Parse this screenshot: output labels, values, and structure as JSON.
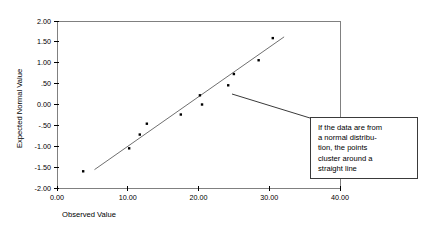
{
  "chart_data": {
    "type": "scatter",
    "title": "",
    "xlabel": "Observed Value",
    "ylabel": "Expected Normal Value",
    "xlim": [
      0,
      40
    ],
    "ylim": [
      -2.0,
      2.0
    ],
    "grid": false,
    "legend": null,
    "x_ticks": [
      "0.00",
      "10.00",
      "20.00",
      "30.00",
      "40.00"
    ],
    "x_tick_values": [
      0,
      10,
      20,
      30,
      40
    ],
    "y_ticks": [
      "2.00",
      "1.50",
      "1.00",
      ".50",
      "0.00",
      "-.50",
      "-1.00",
      "-1.50",
      "-2.00"
    ],
    "y_tick_values": [
      2.0,
      1.5,
      1.0,
      0.5,
      0.0,
      -0.5,
      -1.0,
      -1.5,
      -2.0
    ],
    "points": [
      {
        "x": 3.7,
        "y": -1.6
      },
      {
        "x": 10.2,
        "y": -1.05
      },
      {
        "x": 11.7,
        "y": -0.72
      },
      {
        "x": 12.7,
        "y": -0.46
      },
      {
        "x": 17.5,
        "y": -0.24
      },
      {
        "x": 20.2,
        "y": 0.22
      },
      {
        "x": 20.5,
        "y": 0.0
      },
      {
        "x": 24.2,
        "y": 0.46
      },
      {
        "x": 25.0,
        "y": 0.73
      },
      {
        "x": 28.5,
        "y": 1.06
      },
      {
        "x": 30.5,
        "y": 1.59
      }
    ],
    "fit_line": {
      "x1": 5.3,
      "y1": -1.56,
      "x2": 32.1,
      "y2": 1.62
    },
    "marker": {
      "shape": "square",
      "color": "#000000",
      "size": 2.4
    },
    "line_color": "#707070",
    "frame_color": "#808080"
  },
  "annotation": {
    "text": "If the data are from\na normal distribu-\ntion, the points\ncluster around a\nstraight line",
    "leader": {
      "x1": 232,
      "y1": 94,
      "x2": 310,
      "y2": 118
    }
  }
}
